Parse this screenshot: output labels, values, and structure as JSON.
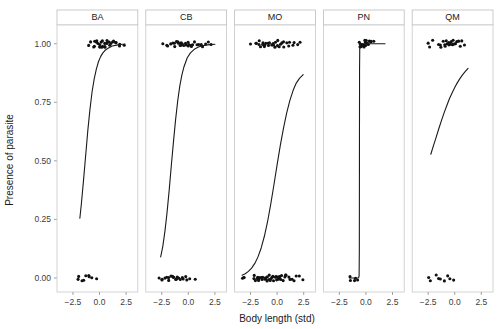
{
  "chart_data": {
    "type": "line",
    "title": "",
    "subtitle": "",
    "xlabel": "Body length (std)",
    "ylabel": "Presence of parasite",
    "xlim": [
      -4.0,
      3.6
    ],
    "ylim": [
      -0.06,
      1.08
    ],
    "x_ticks": [
      -2.5,
      0.0,
      2.5
    ],
    "x_tick_labels": [
      "−2.5",
      "0.0",
      "2.5"
    ],
    "y_ticks": [
      0.0,
      0.25,
      0.5,
      0.75,
      1.0
    ],
    "y_tick_labels": [
      "0.00",
      "0.25",
      "0.50",
      "0.75",
      "1.00"
    ],
    "grid": false,
    "legend": "none",
    "facet_variable": "site",
    "facet_layout": "1 row x 5 columns",
    "line_color": "#1a1a1a",
    "point_color": "#111111",
    "panel_border_color": "#c8c8c8",
    "strip_border_color": "#bdbdbd",
    "panels": [
      {
        "label": "BA",
        "curve": {
          "note": "steep logistic rise",
          "x": [
            -1.85,
            -1.7,
            -1.5,
            -1.3,
            -1.1,
            -0.9,
            -0.7,
            -0.5,
            -0.3,
            -0.1,
            0.1,
            0.3,
            0.5,
            0.8,
            1.2,
            1.6,
            2.0,
            2.4
          ],
          "y": [
            0.255,
            0.32,
            0.42,
            0.525,
            0.63,
            0.72,
            0.795,
            0.85,
            0.892,
            0.923,
            0.945,
            0.96,
            0.971,
            0.981,
            0.99,
            0.994,
            0.997,
            0.999
          ]
        },
        "points_y1": {
          "count": 30,
          "x": [
            -1.05,
            -0.78,
            -0.62,
            -0.5,
            -0.38,
            -0.3,
            -0.22,
            -0.14,
            -0.06,
            0.02,
            0.08,
            0.15,
            0.22,
            0.3,
            0.36,
            0.44,
            0.52,
            0.6,
            0.68,
            0.76,
            0.85,
            0.95,
            1.05,
            1.18,
            1.3,
            1.45,
            1.6,
            1.78,
            2.0,
            2.3
          ],
          "y": 1.0
        },
        "points_y0": {
          "count": 9,
          "x": [
            -2.05,
            -1.9,
            -1.72,
            -1.5,
            -1.22,
            -1.05,
            -0.92,
            -0.72,
            -0.35
          ],
          "y": 0.0
        }
      },
      {
        "label": "CB",
        "curve": {
          "note": "logistic rise from low intercept",
          "x": [
            -2.6,
            -2.4,
            -2.2,
            -2.0,
            -1.8,
            -1.6,
            -1.4,
            -1.2,
            -1.0,
            -0.8,
            -0.6,
            -0.4,
            -0.1,
            0.2,
            0.6,
            1.0,
            1.5,
            2.0,
            2.5
          ],
          "y": [
            0.09,
            0.135,
            0.2,
            0.28,
            0.375,
            0.48,
            0.58,
            0.675,
            0.755,
            0.82,
            0.868,
            0.903,
            0.94,
            0.961,
            0.978,
            0.987,
            0.993,
            0.996,
            0.998
          ]
        },
        "points_y1": {
          "count": 32,
          "x": [
            -2.3,
            -2.05,
            -1.85,
            -1.68,
            -1.5,
            -1.38,
            -1.28,
            -1.18,
            -1.08,
            -0.98,
            -0.88,
            -0.78,
            -0.68,
            -0.58,
            -0.48,
            -0.38,
            -0.28,
            -0.18,
            -0.08,
            0.02,
            0.12,
            0.24,
            0.36,
            0.48,
            0.62,
            0.78,
            0.95,
            1.15,
            1.35,
            1.58,
            1.85,
            2.2
          ],
          "y": 1.0
        },
        "points_y0": {
          "count": 22,
          "x": [
            -2.65,
            -2.5,
            -2.38,
            -2.22,
            -2.08,
            -1.95,
            -1.82,
            -1.7,
            -1.58,
            -1.45,
            -1.32,
            -1.2,
            -1.08,
            -0.95,
            -0.82,
            -0.7,
            -0.58,
            -0.45,
            -0.3,
            -0.12,
            0.2,
            0.62
          ],
          "y": 0.0
        }
      },
      {
        "label": "MO",
        "curve": {
          "note": "broad sigmoid, does not saturate",
          "x": [
            -3.3,
            -3.0,
            -2.7,
            -2.4,
            -2.1,
            -1.8,
            -1.5,
            -1.2,
            -0.9,
            -0.6,
            -0.3,
            0.0,
            0.3,
            0.6,
            0.9,
            1.2,
            1.5,
            1.8,
            2.1,
            2.45
          ],
          "y": [
            0.012,
            0.018,
            0.028,
            0.042,
            0.062,
            0.09,
            0.128,
            0.178,
            0.24,
            0.315,
            0.398,
            0.484,
            0.566,
            0.64,
            0.705,
            0.758,
            0.8,
            0.832,
            0.852,
            0.868
          ]
        },
        "points_y1": {
          "count": 34,
          "x": [
            -2.6,
            -2.05,
            -1.9,
            -1.78,
            -1.65,
            -1.52,
            -1.4,
            -1.3,
            -1.2,
            -1.1,
            -1.0,
            -0.9,
            -0.8,
            -0.7,
            -0.6,
            -0.5,
            -0.4,
            -0.3,
            -0.2,
            -0.1,
            0.0,
            0.1,
            0.22,
            0.34,
            0.46,
            0.58,
            0.7,
            0.85,
            1.0,
            1.2,
            1.4,
            1.65,
            1.9,
            2.2
          ],
          "y": 1.0
        },
        "points_y0": {
          "count": 48,
          "x": [
            -3.35,
            -3.2,
            -3.05,
            -2.25,
            -2.12,
            -2.0,
            -1.9,
            -1.82,
            -1.74,
            -1.66,
            -1.58,
            -1.5,
            -1.42,
            -1.34,
            -1.26,
            -1.18,
            -1.1,
            -1.02,
            -0.94,
            -0.86,
            -0.78,
            -0.7,
            -0.62,
            -0.54,
            -0.46,
            -0.38,
            -0.3,
            -0.22,
            -0.14,
            -0.06,
            0.02,
            0.1,
            0.18,
            0.26,
            0.34,
            0.42,
            0.5,
            0.6,
            0.7,
            0.8,
            0.92,
            1.05,
            1.2,
            1.38,
            1.58,
            1.82,
            2.1,
            2.42
          ],
          "y": 0.0
        }
      },
      {
        "label": "PN",
        "curve": {
          "note": "near-vertical step (complete separation) at approx x = -0.62",
          "x": [
            -1.55,
            -1.3,
            -1.0,
            -0.8,
            -0.68,
            -0.64,
            -0.62,
            -0.61,
            -0.6,
            -0.58,
            -0.5,
            -0.3,
            0.2,
            0.9,
            1.8
          ],
          "y": [
            0.0,
            0.0,
            0.0,
            0.0,
            0.001,
            0.01,
            0.12,
            0.5,
            0.88,
            0.99,
            1.0,
            1.0,
            1.0,
            1.0,
            1.0
          ]
        },
        "points_y1": {
          "count": 18,
          "x": [
            -0.62,
            -0.55,
            -0.48,
            -0.42,
            -0.36,
            -0.3,
            -0.24,
            -0.18,
            -0.12,
            -0.06,
            0.0,
            0.06,
            0.14,
            0.22,
            0.3,
            0.4,
            0.52,
            0.66
          ],
          "y": 1.0
        },
        "points_y0": {
          "count": 5,
          "x": [
            -1.52,
            -1.42,
            -1.05,
            -0.88,
            -0.72
          ],
          "y": 0.0
        }
      },
      {
        "label": "QM",
        "curve": {
          "note": "shallow rise, truncated range",
          "x": [
            -2.25,
            -2.0,
            -1.75,
            -1.5,
            -1.25,
            -1.0,
            -0.75,
            -0.5,
            -0.25,
            0.0,
            0.25,
            0.5,
            0.75,
            1.0,
            1.25
          ],
          "y": [
            0.528,
            0.565,
            0.6,
            0.637,
            0.672,
            0.705,
            0.735,
            0.765,
            0.79,
            0.813,
            0.834,
            0.852,
            0.868,
            0.882,
            0.895
          ]
        },
        "points_y1": {
          "count": 24,
          "x": [
            -2.55,
            -2.42,
            -2.05,
            -1.55,
            -1.4,
            -1.25,
            -1.12,
            -1.0,
            -0.9,
            -0.8,
            -0.7,
            -0.6,
            -0.5,
            -0.4,
            -0.3,
            -0.2,
            -0.1,
            0.0,
            0.12,
            0.25,
            0.4,
            0.55,
            0.72,
            0.92
          ],
          "y": 1.0
        },
        "points_y0": {
          "count": 9,
          "x": [
            -2.5,
            -2.35,
            -1.72,
            -1.55,
            -1.4,
            -0.92,
            -0.7,
            -0.52,
            -0.1
          ],
          "y": 0.0
        }
      }
    ]
  }
}
